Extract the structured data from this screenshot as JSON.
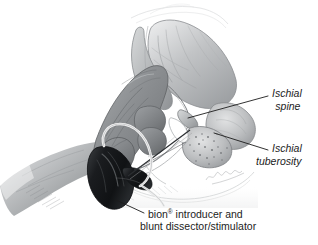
{
  "figure": {
    "kind": "medical-illustration",
    "medium": "graphite pencil drawing, grayscale",
    "background_color": "#ffffff",
    "ink_color": "#1c1c1c"
  },
  "labels": {
    "ischial_spine": {
      "line1": "Ischial",
      "line2": "spine",
      "style": "italic"
    },
    "ischial_tuberosity": {
      "line1": "Ischial",
      "line2": "tuberosity",
      "style": "italic"
    },
    "device": {
      "line1_pre": "bion",
      "line1_mark": "®",
      "line1_post": " introducer and",
      "line2": "blunt dissector/stimulator",
      "style": "roman"
    }
  },
  "leader_lines": [
    {
      "name": "leader-ischial-spine",
      "from": [
        268,
        96
      ],
      "to": [
        188,
        118
      ]
    },
    {
      "name": "leader-ischial-tuberosity",
      "from": [
        268,
        150
      ],
      "to": [
        214,
        132
      ]
    },
    {
      "name": "leader-device",
      "from": [
        144,
        213
      ],
      "to": [
        116,
        201
      ]
    }
  ],
  "elements": {
    "glove": {
      "name": "surgical glove",
      "color": "#8c8f92"
    },
    "sleeve": {
      "name": "gown sleeve",
      "color": "#b9bbbd"
    },
    "device_body": {
      "name": "bion introducer handle",
      "color": "#16181a"
    },
    "cable": {
      "name": "stimulator cable",
      "color": "#f2f2f2"
    },
    "bone": {
      "name": "pelvis / ischium",
      "color": "#9a9c9f"
    }
  }
}
